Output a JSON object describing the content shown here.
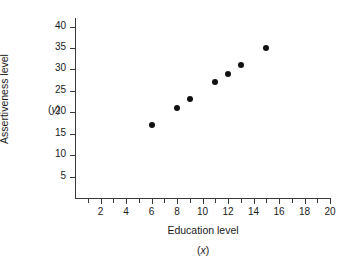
{
  "chart_data": {
    "type": "scatter",
    "title": "",
    "xlabel": "Education level",
    "xsymbol": "(x)",
    "ylabel": "Assertiveness level",
    "ysymbol": "(y)",
    "xlim": [
      0,
      20
    ],
    "ylim": [
      0,
      42
    ],
    "grid": false,
    "legend": null,
    "marker_color": "#111111",
    "axis_color": "#3a3a3a",
    "background_color": "#ffffff",
    "x_tick_labels": [
      "2",
      "4",
      "6",
      "8",
      "10",
      "12",
      "14",
      "16",
      "18",
      "20"
    ],
    "x_tick_values": [
      2,
      4,
      6,
      8,
      10,
      12,
      14,
      16,
      18,
      20
    ],
    "x_minor_tick_values": [
      1,
      2,
      3,
      4,
      5,
      6,
      7,
      8,
      9,
      10,
      11,
      12,
      13,
      14,
      15,
      16,
      17,
      18,
      19,
      20
    ],
    "y_tick_labels": [
      "5",
      "10",
      "15",
      "20",
      "25",
      "30",
      "35",
      "40"
    ],
    "y_tick_values": [
      5,
      10,
      15,
      20,
      25,
      30,
      35,
      40
    ],
    "x": [
      6,
      8,
      9,
      11,
      12,
      13,
      15
    ],
    "y": [
      17,
      21,
      23,
      27,
      29,
      31,
      35
    ],
    "points": [
      {
        "x": 6,
        "y": 17
      },
      {
        "x": 8,
        "y": 21
      },
      {
        "x": 9,
        "y": 23
      },
      {
        "x": 11,
        "y": 27
      },
      {
        "x": 12,
        "y": 29
      },
      {
        "x": 13,
        "y": 31
      },
      {
        "x": 15,
        "y": 35
      }
    ]
  }
}
